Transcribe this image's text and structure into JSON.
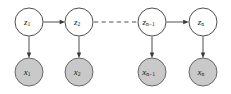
{
  "diagram": {
    "type": "probabilistic-graphical-model",
    "title": "",
    "background_color": "#ffffff",
    "colors": {
      "latent_fill": "#ffffff",
      "observed_fill": "#c9c9c9",
      "stroke": "#3a3a3a",
      "label": "#141414"
    },
    "latent_nodes": [
      {
        "id": "z1",
        "base": "z",
        "subscript": "1",
        "cx": 29,
        "cy": 22,
        "r": 14
      },
      {
        "id": "z2",
        "base": "z",
        "subscript": "2",
        "cx": 79,
        "cy": 22,
        "r": 14
      },
      {
        "id": "zn-1",
        "base": "z",
        "subscript": "n−1",
        "cx": 152,
        "cy": 22,
        "r": 14
      },
      {
        "id": "zn",
        "base": "z",
        "subscript": "n",
        "cx": 203,
        "cy": 22,
        "r": 14
      }
    ],
    "observed_nodes": [
      {
        "id": "x1",
        "base": "x",
        "subscript": "1",
        "cx": 29,
        "cy": 72,
        "r": 14
      },
      {
        "id": "x2",
        "base": "x",
        "subscript": "2",
        "cx": 79,
        "cy": 72,
        "r": 14
      },
      {
        "id": "xn-1",
        "base": "x",
        "subscript": "n−1",
        "cx": 152,
        "cy": 72,
        "r": 14
      },
      {
        "id": "xn",
        "base": "x",
        "subscript": "n",
        "cx": 203,
        "cy": 72,
        "r": 14
      }
    ],
    "horizontal_edges": [
      {
        "from": "z1",
        "to": "z2",
        "style": "solid",
        "arrow": true
      },
      {
        "from": "z2",
        "to": "zn-1",
        "style": "dashed",
        "arrow": false
      },
      {
        "from": "zn-1",
        "to": "zn",
        "style": "solid",
        "arrow": true
      }
    ],
    "vertical_edges": [
      {
        "from": "z1",
        "to": "x1",
        "style": "solid",
        "arrow": true
      },
      {
        "from": "z2",
        "to": "x2",
        "style": "solid",
        "arrow": true
      },
      {
        "from": "zn-1",
        "to": "xn-1",
        "style": "solid",
        "arrow": true
      },
      {
        "from": "zn",
        "to": "xn",
        "style": "solid",
        "arrow": true
      }
    ]
  }
}
